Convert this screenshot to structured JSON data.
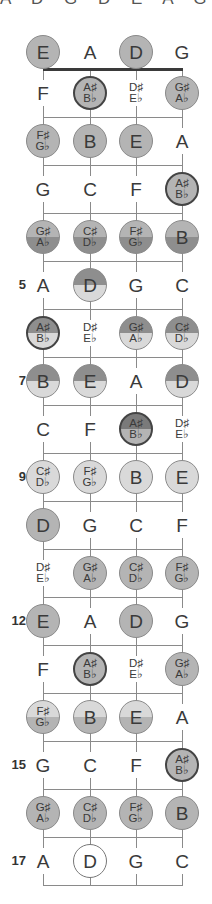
{
  "diagram": {
    "top_clipped_text": "A D G D E A G",
    "tuning": [
      "E",
      "A",
      "D",
      "G"
    ],
    "string_x": [
      43,
      90,
      136,
      182
    ],
    "colors": {
      "line": "#8a8a8a",
      "nut": "#3a3a3a",
      "medium": "#b4b4b4",
      "dark": "#8e8e8e",
      "light": "#d9d9d9",
      "white": "#ffffff"
    },
    "fret_numbers": [
      {
        "fret": 5,
        "label": "5"
      },
      {
        "fret": 7,
        "label": "7"
      },
      {
        "fret": 9,
        "label": "9"
      },
      {
        "fret": 12,
        "label": "12"
      },
      {
        "fret": 15,
        "label": "15"
      },
      {
        "fret": 17,
        "label": "17"
      }
    ],
    "rows": [
      {
        "fret": 0,
        "notes": [
          {
            "t": "E",
            "s": "medium"
          },
          {
            "t": "A",
            "s": "plain"
          },
          {
            "t": "D",
            "s": "medium"
          },
          {
            "t": "G",
            "s": "plain"
          }
        ]
      },
      {
        "fret": 1,
        "notes": [
          {
            "t": "F",
            "s": "plain"
          },
          {
            "t": "A♯|B♭",
            "s": "medium-thick"
          },
          {
            "t": "D♯|E♭",
            "s": "plain"
          },
          {
            "t": "G♯|A♭",
            "s": "medium"
          }
        ]
      },
      {
        "fret": 2,
        "notes": [
          {
            "t": "F♯|G♭",
            "s": "medium"
          },
          {
            "t": "B",
            "s": "medium"
          },
          {
            "t": "E",
            "s": "medium"
          },
          {
            "t": "A",
            "s": "plain"
          }
        ]
      },
      {
        "fret": 3,
        "notes": [
          {
            "t": "G",
            "s": "plain"
          },
          {
            "t": "C",
            "s": "plain"
          },
          {
            "t": "F",
            "s": "plain"
          },
          {
            "t": "A♯|B♭",
            "s": "medium-thick"
          }
        ]
      },
      {
        "fret": 4,
        "notes": [
          {
            "t": "G♯|A♭",
            "s": "medium-dark"
          },
          {
            "t": "C♯|D♭",
            "s": "medium-dark"
          },
          {
            "t": "F♯|G♭",
            "s": "medium-dark"
          },
          {
            "t": "B",
            "s": "medium-dark"
          }
        ]
      },
      {
        "fret": 5,
        "notes": [
          {
            "t": "A",
            "s": "plain"
          },
          {
            "t": "D",
            "s": "dark-light"
          },
          {
            "t": "G",
            "s": "plain"
          },
          {
            "t": "C",
            "s": "plain"
          }
        ]
      },
      {
        "fret": 6,
        "notes": [
          {
            "t": "A♯|B♭",
            "s": "dark-light-thick"
          },
          {
            "t": "D♯|E♭",
            "s": "plain"
          },
          {
            "t": "G♯|A♭",
            "s": "dark-light"
          },
          {
            "t": "C♯|D♭",
            "s": "dark-light"
          }
        ]
      },
      {
        "fret": 7,
        "notes": [
          {
            "t": "B",
            "s": "dark-light"
          },
          {
            "t": "E",
            "s": "dark-light"
          },
          {
            "t": "A",
            "s": "plain"
          },
          {
            "t": "D",
            "s": "dark-light"
          }
        ]
      },
      {
        "fret": 8,
        "notes": [
          {
            "t": "C",
            "s": "plain"
          },
          {
            "t": "F",
            "s": "plain"
          },
          {
            "t": "A♯|B♭",
            "s": "darker-medium-thick"
          },
          {
            "t": "D♯|E♭",
            "s": "plain"
          }
        ]
      },
      {
        "fret": 9,
        "notes": [
          {
            "t": "C♯|D♭",
            "s": "light"
          },
          {
            "t": "F♯|G♭",
            "s": "light"
          },
          {
            "t": "B",
            "s": "light"
          },
          {
            "t": "E",
            "s": "light"
          }
        ]
      },
      {
        "fret": 10,
        "notes": [
          {
            "t": "D",
            "s": "medium"
          },
          {
            "t": "G",
            "s": "plain"
          },
          {
            "t": "C",
            "s": "plain"
          },
          {
            "t": "F",
            "s": "plain"
          }
        ]
      },
      {
        "fret": 11,
        "notes": [
          {
            "t": "D♯|E♭",
            "s": "plain"
          },
          {
            "t": "G♯|A♭",
            "s": "medium"
          },
          {
            "t": "C♯|D♭",
            "s": "medium"
          },
          {
            "t": "F♯|G♭",
            "s": "medium"
          }
        ]
      },
      {
        "fret": 12,
        "notes": [
          {
            "t": "E",
            "s": "medium"
          },
          {
            "t": "A",
            "s": "plain"
          },
          {
            "t": "D",
            "s": "medium"
          },
          {
            "t": "G",
            "s": "plain"
          }
        ]
      },
      {
        "fret": 13,
        "notes": [
          {
            "t": "F",
            "s": "plain"
          },
          {
            "t": "A♯|B♭",
            "s": "medium-thick"
          },
          {
            "t": "D♯|E♭",
            "s": "plain"
          },
          {
            "t": "G♯|A♭",
            "s": "medium"
          }
        ]
      },
      {
        "fret": 14,
        "notes": [
          {
            "t": "F♯|G♭",
            "s": "light-medium"
          },
          {
            "t": "B",
            "s": "light-medium"
          },
          {
            "t": "E",
            "s": "light-medium"
          },
          {
            "t": "A",
            "s": "plain"
          }
        ]
      },
      {
        "fret": 15,
        "notes": [
          {
            "t": "G",
            "s": "plain"
          },
          {
            "t": "C",
            "s": "plain"
          },
          {
            "t": "F",
            "s": "plain"
          },
          {
            "t": "A♯|B♭",
            "s": "medium-thick"
          }
        ]
      },
      {
        "fret": 16,
        "notes": [
          {
            "t": "G♯|A♭",
            "s": "medium"
          },
          {
            "t": "C♯|D♭",
            "s": "medium"
          },
          {
            "t": "F♯|G♭",
            "s": "medium"
          },
          {
            "t": "B",
            "s": "medium"
          }
        ]
      },
      {
        "fret": 17,
        "notes": [
          {
            "t": "A",
            "s": "plain"
          },
          {
            "t": "D",
            "s": "outline"
          },
          {
            "t": "G",
            "s": "plain"
          },
          {
            "t": "C",
            "s": "plain"
          }
        ]
      }
    ]
  }
}
